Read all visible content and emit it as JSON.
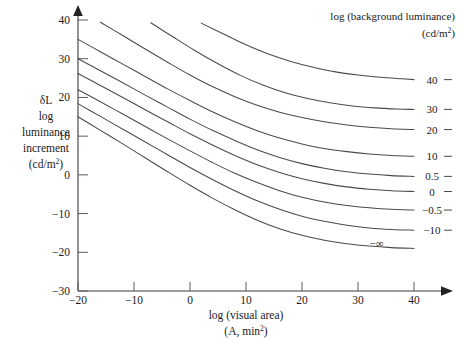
{
  "chart_data": {
    "type": "line",
    "title": "",
    "xlabel": "log (visual area) (A, min2)",
    "xlabel_line1": "log (visual area)",
    "xlabel_line2_prefix": "(A, min",
    "xlabel_line2_sup": "2",
    "xlabel_line2_suffix": ")",
    "ylabel_lines": [
      "δL",
      "log",
      "luminance",
      "increment",
      "(cd/m"
    ],
    "ylabel_sup": "2",
    "ylabel_suffix": ")",
    "legend_title_line1": "log (background luminance)",
    "legend_title_line2_prefix": "(cd/m",
    "legend_title_line2_sup": "2",
    "legend_title_line2_suffix": ")",
    "legend_position": "top-right",
    "grid": false,
    "xlim": [
      -20,
      40
    ],
    "ylim": [
      -30,
      40
    ],
    "xticks": [
      -20,
      -10,
      0,
      10,
      20,
      30,
      40
    ],
    "xtick_labels": [
      "−20",
      "−10",
      "0",
      "10",
      "20",
      "30",
      "40"
    ],
    "yticks": [
      -30,
      -20,
      -10,
      0,
      10,
      20,
      30,
      40
    ],
    "ytick_labels": [
      "−30",
      "−20",
      "−10",
      "0",
      "10",
      "20",
      "30",
      "40"
    ],
    "series": [
      {
        "name": "40",
        "label": "40",
        "x": [
          2,
          6,
          10,
          14,
          18,
          22,
          26,
          30,
          34,
          38,
          40
        ],
        "y": [
          39.2,
          36.4,
          33.6,
          31.2,
          29.3,
          27.8,
          26.6,
          25.8,
          25.2,
          24.8,
          24.6
        ]
      },
      {
        "name": "30",
        "label": "30",
        "x": [
          -7,
          -3,
          1,
          5,
          9,
          13,
          17,
          21,
          25,
          29,
          33,
          37,
          40
        ],
        "y": [
          39.3,
          35.6,
          32.0,
          28.7,
          25.7,
          23.2,
          21.2,
          19.7,
          18.6,
          17.8,
          17.3,
          17.0,
          16.9
        ]
      },
      {
        "name": "20",
        "label": "20",
        "x": [
          -16,
          -12,
          -8,
          -4,
          0,
          4,
          8,
          12,
          16,
          20,
          24,
          28,
          32,
          36,
          40
        ],
        "y": [
          39.4,
          36.0,
          32.5,
          29.1,
          25.8,
          22.8,
          20.2,
          18.0,
          16.2,
          14.8,
          13.7,
          12.9,
          12.3,
          11.9,
          11.7
        ]
      },
      {
        "name": "10",
        "label": "10",
        "x": [
          -20,
          -16,
          -12,
          -8,
          -4,
          0,
          4,
          8,
          12,
          16,
          20,
          24,
          28,
          32,
          36,
          40
        ],
        "y": [
          35.0,
          31.8,
          28.6,
          25.4,
          22.2,
          19.2,
          16.3,
          13.7,
          11.4,
          9.5,
          8.0,
          6.8,
          6.0,
          5.4,
          5.0,
          4.8
        ]
      },
      {
        "name": "0.5",
        "label": "0.5",
        "x": [
          -20,
          -16,
          -12,
          -8,
          -4,
          0,
          4,
          8,
          12,
          16,
          20,
          24,
          28,
          32,
          36,
          40
        ],
        "y": [
          30.0,
          26.9,
          23.8,
          20.6,
          17.5,
          14.4,
          11.5,
          8.9,
          6.5,
          4.5,
          2.9,
          1.7,
          0.8,
          0.2,
          -0.2,
          -0.4
        ]
      },
      {
        "name": "0",
        "label": "0",
        "x": [
          -20,
          -16,
          -12,
          -8,
          -4,
          0,
          4,
          8,
          12,
          16,
          20,
          24,
          28,
          32,
          36,
          40
        ],
        "y": [
          26.2,
          23.1,
          20.0,
          16.8,
          13.7,
          10.6,
          7.7,
          5.0,
          2.6,
          0.6,
          -1.0,
          -2.2,
          -3.1,
          -3.7,
          -4.1,
          -4.3
        ]
      },
      {
        "name": "-0.5",
        "label": "−0.5",
        "x": [
          -20,
          -16,
          -12,
          -8,
          -4,
          0,
          4,
          8,
          12,
          16,
          20,
          24,
          28,
          32,
          36,
          40
        ],
        "y": [
          22.0,
          18.9,
          15.7,
          12.5,
          9.3,
          6.2,
          3.2,
          0.4,
          -2.0,
          -4.1,
          -5.8,
          -7.0,
          -7.9,
          -8.5,
          -8.9,
          -9.1
        ]
      },
      {
        "name": "-10",
        "label": "−10",
        "x": [
          -20,
          -16,
          -12,
          -8,
          -4,
          0,
          4,
          8,
          12,
          16,
          20,
          24,
          28,
          32,
          36,
          40
        ],
        "y": [
          18.4,
          15.1,
          11.8,
          8.5,
          5.2,
          1.9,
          -1.2,
          -4.1,
          -6.7,
          -8.9,
          -10.7,
          -12.0,
          -13.0,
          -13.7,
          -14.1,
          -14.3
        ]
      },
      {
        "name": "-inf",
        "label": "−∞",
        "x": [
          -20,
          -16,
          -12,
          -8,
          -4,
          0,
          4,
          8,
          12,
          16,
          20,
          24,
          28,
          32,
          36,
          40
        ],
        "y": [
          15.0,
          11.5,
          8.0,
          4.4,
          0.8,
          -2.7,
          -6.0,
          -9.0,
          -11.7,
          -13.9,
          -15.6,
          -16.9,
          -17.8,
          -18.4,
          -18.8,
          -19.0
        ]
      }
    ],
    "curve_labels": [
      {
        "label": "40",
        "y_value": 24.6
      },
      {
        "label": "30",
        "y_value": 16.9
      },
      {
        "label": "20",
        "y_value": 11.7
      },
      {
        "label": "10",
        "y_value": 4.8
      },
      {
        "label": "0.5",
        "y_value": -0.4
      },
      {
        "label": "0",
        "y_value": -4.3
      },
      {
        "label": "−0.5",
        "y_value": -9.1
      },
      {
        "label": "−10",
        "y_value": -14.3
      },
      {
        "label": "−∞",
        "y_value": -19.0
      }
    ],
    "colors": {
      "curve": "#4a4a4a",
      "axis": "#3a3a3a",
      "text": "#1a1a1a",
      "background": "#ffffff"
    }
  }
}
